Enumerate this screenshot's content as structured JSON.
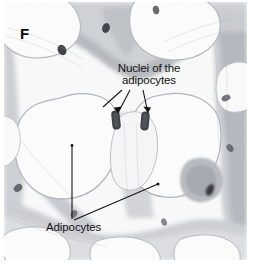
{
  "figure": {
    "panel_letter": "F",
    "type": "histology-micrograph",
    "background_color": "#ffffff",
    "image_area": {
      "x": 4,
      "y": 2,
      "width": 243,
      "height": 258
    }
  },
  "annotations": [
    {
      "id": "nuclei",
      "line1": "Nuclei of the",
      "line2": "adipocytes",
      "text_color": "#121212",
      "leader_targets": 3
    },
    {
      "id": "adipocytes",
      "label": "Adipocytes",
      "text_color": "#121212",
      "leader_targets": 2
    }
  ],
  "palette": {
    "lipid_droplet": "#fdfdfd",
    "cell_membrane": "#b9bcc0",
    "stroma_light": "#d8dadd",
    "stroma_mid": "#bcbfc4",
    "stroma_dark": "#9a9ea5",
    "nucleus": "#4a4d55",
    "nucleus_dark": "#2f3238",
    "leader_line": "#151515"
  }
}
